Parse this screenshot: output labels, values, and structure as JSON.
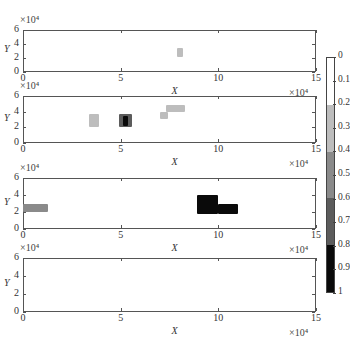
{
  "chart_data": [
    {
      "type": "heatmap",
      "panel": 1,
      "xlabel": "X",
      "ylabel": "Y",
      "x_exponent": "×10⁴",
      "y_exponent": "×10⁴",
      "xlim": [
        0,
        15
      ],
      "ylim": [
        0,
        6
      ],
      "xticks": [
        "0",
        "5",
        "10",
        "15"
      ],
      "yticks": [
        "0",
        "2",
        "4",
        "6"
      ],
      "regions": [
        {
          "x": [
            7.9,
            8.2
          ],
          "y": [
            2.2,
            3.4
          ],
          "value": 0.3
        }
      ]
    },
    {
      "type": "heatmap",
      "panel": 2,
      "xlabel": "X",
      "ylabel": "Y",
      "x_exponent": "×10⁴",
      "y_exponent": "×10⁴",
      "xlim": [
        0,
        15
      ],
      "ylim": [
        0,
        6
      ],
      "xticks": [
        "0",
        "5",
        "10",
        "15"
      ],
      "yticks": [
        "0",
        "2",
        "4",
        "6"
      ],
      "regions": [
        {
          "x": [
            3.4,
            3.9
          ],
          "y": [
            2.0,
            3.7
          ],
          "value": 0.3
        },
        {
          "x": [
            4.9,
            5.6
          ],
          "y": [
            2.0,
            3.7
          ],
          "value": 0.7
        },
        {
          "x": [
            5.1,
            5.4
          ],
          "y": [
            2.2,
            3.5
          ],
          "value": 0.95
        },
        {
          "x": [
            7.0,
            7.4
          ],
          "y": [
            3.0,
            4.0
          ],
          "value": 0.3
        },
        {
          "x": [
            7.3,
            8.3
          ],
          "y": [
            4.0,
            4.8
          ],
          "value": 0.3
        }
      ]
    },
    {
      "type": "heatmap",
      "panel": 3,
      "xlabel": "X",
      "ylabel": "Y",
      "x_exponent": "×10⁴",
      "y_exponent": "×10⁴",
      "xlim": [
        0,
        15
      ],
      "ylim": [
        0,
        6
      ],
      "xticks": [
        "0",
        "5",
        "10",
        "15"
      ],
      "yticks": [
        "0",
        "2",
        "4",
        "6"
      ],
      "regions": [
        {
          "x": [
            0,
            1.3
          ],
          "y": [
            2.0,
            3.0
          ],
          "value": 0.6
        },
        {
          "x": [
            8.9,
            10.0
          ],
          "y": [
            1.8,
            4.0
          ],
          "value": 0.95
        },
        {
          "x": [
            10.0,
            11.0
          ],
          "y": [
            1.8,
            3.0
          ],
          "value": 0.9
        }
      ]
    },
    {
      "type": "heatmap",
      "panel": 4,
      "xlabel": "X",
      "ylabel": "Y",
      "x_exponent": "×10⁴",
      "y_exponent": "×10⁴",
      "xlim": [
        0,
        15
      ],
      "ylim": [
        0,
        6
      ],
      "xticks": [
        "0",
        "5",
        "10",
        "15"
      ],
      "yticks": [
        "0",
        "2",
        "4",
        "6"
      ],
      "regions": []
    }
  ],
  "colorbar": {
    "labels": [
      "0",
      "0.1",
      "0.2",
      "0.3",
      "0.4",
      "0.5",
      "0.6",
      "0.7",
      "0.8",
      "0.9",
      "1"
    ],
    "segments": [
      {
        "from": 0.0,
        "to": 0.2,
        "color": "#ffffff"
      },
      {
        "from": 0.2,
        "to": 0.4,
        "color": "#bdbdbd"
      },
      {
        "from": 0.4,
        "to": 0.6,
        "color": "#8a8a8a"
      },
      {
        "from": 0.6,
        "to": 0.8,
        "color": "#5c5c5c"
      },
      {
        "from": 0.8,
        "to": 1.0,
        "color": "#0a0a0a"
      }
    ]
  },
  "labels": {
    "exponent": "×10⁴",
    "x": "X",
    "y": "Y",
    "ytick0": "0",
    "ytick2": "2",
    "ytick4": "4",
    "ytick6": "6",
    "xtick0": "0",
    "xtick5": "5",
    "xtick10": "10",
    "xtick15": "15"
  }
}
